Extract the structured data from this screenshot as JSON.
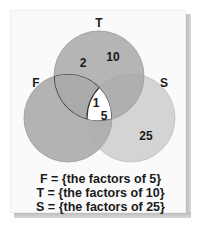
{
  "diagram": {
    "type": "venn",
    "sets": [
      {
        "id": "T",
        "label": "T",
        "color": "#a9a9a9"
      },
      {
        "id": "F",
        "label": "F",
        "color": "#a9a9a9"
      },
      {
        "id": "S",
        "label": "S",
        "color": "#d2d2d2"
      }
    ],
    "regions": [
      {
        "sets": [
          "T"
        ],
        "values": [
          "2",
          "10"
        ]
      },
      {
        "sets": [
          "F",
          "T",
          "S"
        ],
        "values": [
          "1",
          "5"
        ]
      },
      {
        "sets": [
          "S"
        ],
        "values": [
          "25"
        ]
      }
    ],
    "labels": {
      "T": "T",
      "F": "F",
      "S": "S"
    },
    "values": {
      "t_only_a": "2",
      "t_only_b": "10",
      "center_a": "1",
      "center_b": "5",
      "s_only": "25"
    }
  },
  "legend": {
    "lines": [
      "F = {the factors of 5}",
      "T = {the factors of 10}",
      "S = {the factors of 25}"
    ]
  }
}
